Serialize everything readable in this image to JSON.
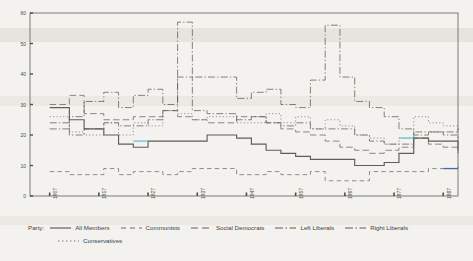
{
  "chart_data": {
    "type": "line",
    "title": "",
    "subtitle": "",
    "xlabel": "",
    "ylabel": "",
    "xlim": [
      1903,
      1990
    ],
    "ylim": [
      0,
      60
    ],
    "yticks": [
      0,
      10,
      20,
      30,
      40,
      50,
      60
    ],
    "xticks": [
      1907,
      1917,
      1927,
      1937,
      1947,
      1957,
      1967,
      1977,
      1987
    ],
    "xtick_labels": [
      "1907",
      "1917",
      "1927",
      "1937",
      "1947",
      "1957",
      "1967",
      "1977",
      "1987"
    ],
    "ytick_labels": [
      "0",
      "10",
      "20",
      "30",
      "40",
      "50",
      "60"
    ],
    "grid": false,
    "drawstyle": "steps-post",
    "legend_position": "below",
    "legend_title": "Party:",
    "series": [
      {
        "name": "All Members",
        "style": "solid",
        "color": "#555552",
        "x": [
          1907,
          1911,
          1914,
          1918,
          1921,
          1924,
          1927,
          1930,
          1933,
          1936,
          1939,
          1942,
          1945,
          1948,
          1951,
          1954,
          1957,
          1960,
          1963,
          1966,
          1969,
          1972,
          1975,
          1978,
          1981,
          1984,
          1987,
          1990
        ],
        "values": [
          29,
          25,
          22,
          20,
          17,
          16,
          18,
          18,
          18,
          18,
          20,
          20,
          19,
          17,
          15,
          14,
          13,
          12,
          12,
          12,
          10,
          10,
          11,
          14,
          19,
          18,
          18,
          15
        ]
      },
      {
        "name": "Communists",
        "style": "dashed",
        "color": "#6b6b66",
        "x": [
          1907,
          1911,
          1918,
          1921,
          1924,
          1927,
          1930,
          1933,
          1936,
          1939,
          1945,
          1948,
          1951,
          1954,
          1957,
          1960,
          1963,
          1966,
          1969,
          1972,
          1975,
          1978,
          1981,
          1984,
          1987,
          1990
        ],
        "values": [
          8,
          7,
          9,
          7,
          8,
          8,
          7,
          8,
          9,
          9,
          7,
          7,
          8,
          7,
          7,
          8,
          5,
          5,
          5,
          8,
          8,
          8,
          8,
          9,
          9,
          10
        ]
      },
      {
        "name": "Social Democrats",
        "style": "longdash",
        "color": "#62625d",
        "x": [
          1907,
          1911,
          1914,
          1918,
          1921,
          1924,
          1927,
          1930,
          1933,
          1936,
          1939,
          1945,
          1948,
          1951,
          1954,
          1957,
          1960,
          1963,
          1966,
          1969,
          1972,
          1975,
          1978,
          1981,
          1984,
          1987,
          1990
        ],
        "values": [
          30,
          33,
          27,
          25,
          25,
          26,
          26,
          28,
          26,
          25,
          24,
          26,
          26,
          24,
          22,
          21,
          20,
          18,
          16,
          15,
          14,
          15,
          16,
          19,
          17,
          16,
          14
        ]
      },
      {
        "name": "Left Liberals",
        "style": "dashdot",
        "color": "#58584f",
        "x": [
          1907,
          1911,
          1914,
          1918,
          1921,
          1924,
          1927,
          1930,
          1933,
          1936,
          1945,
          1948,
          1951,
          1954,
          1957,
          1960,
          1963,
          1966,
          1969,
          1972,
          1975,
          1978,
          1981,
          1984,
          1987,
          1990
        ],
        "values": [
          22,
          26,
          31,
          34,
          29,
          33,
          35,
          30,
          57,
          39,
          32,
          34,
          35,
          30,
          29,
          38,
          56,
          39,
          31,
          29,
          26,
          22,
          20,
          21,
          21,
          22
        ]
      },
      {
        "name": "Right Liberals",
        "style": "dashdot2",
        "color": "#5a5a55",
        "x": [
          1907,
          1911,
          1914,
          1918,
          1921,
          1924,
          1927,
          1930,
          1933,
          1936,
          1939,
          1945,
          1948,
          1951,
          1954,
          1957,
          1960,
          1963,
          1966,
          1969,
          1972,
          1975,
          1978,
          1981,
          1984,
          1987,
          1990
        ],
        "values": [
          24,
          20,
          22,
          24,
          23,
          23,
          25,
          28,
          39,
          28,
          27,
          25,
          26,
          24,
          23,
          24,
          22,
          22,
          22,
          20,
          18,
          17,
          17,
          21,
          21,
          20,
          18
        ]
      },
      {
        "name": "Conservatives",
        "style": "dotted",
        "color": "#70706a",
        "x": [
          1907,
          1911,
          1914,
          1918,
          1921,
          1924,
          1927,
          1930,
          1933,
          1936,
          1939,
          1945,
          1948,
          1951,
          1954,
          1957,
          1960,
          1963,
          1966,
          1969,
          1972,
          1975,
          1978,
          1981,
          1984,
          1987,
          1990
        ],
        "values": [
          26,
          21,
          20,
          24,
          20,
          24,
          23,
          28,
          27,
          25,
          26,
          24,
          24,
          27,
          24,
          26,
          22,
          25,
          23,
          20,
          19,
          17,
          19,
          26,
          24,
          23,
          21
        ]
      }
    ],
    "highlights": [
      {
        "label": "highlight-segment-left",
        "color": "#62c6d4",
        "x0": 1924,
        "x1": 1927,
        "y": 18
      },
      {
        "label": "highlight-segment-right",
        "color": "#62c6d4",
        "x0": 1978,
        "x1": 1981,
        "y": 19
      },
      {
        "label": "highlight-segment-lower-right",
        "color": "#4169b8",
        "x0": 1987,
        "x1": 1990,
        "y": 9
      }
    ]
  },
  "legend": {
    "title": "Party:",
    "items": [
      {
        "label": "All Members",
        "style": "solid"
      },
      {
        "label": "Communists",
        "style": "dashed"
      },
      {
        "label": "Social Democrats",
        "style": "longdash"
      },
      {
        "label": "Left Liberals",
        "style": "dashdot"
      },
      {
        "label": "Right Liberals",
        "style": "dashdot2"
      },
      {
        "label": "Conservatives",
        "style": "dotted"
      }
    ]
  }
}
